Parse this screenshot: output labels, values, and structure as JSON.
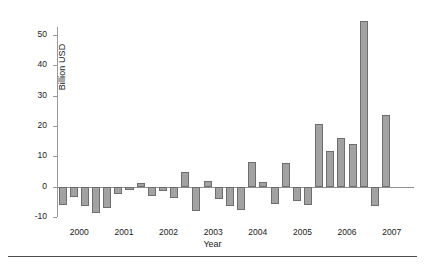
{
  "chart_data": {
    "type": "bar",
    "title": "",
    "xlabel": "Year",
    "ylabel": "Billion USD",
    "ylim": [
      -10,
      55
    ],
    "yticks": [
      -10,
      0,
      10,
      20,
      30,
      40,
      50
    ],
    "ytick_labels": [
      "-10",
      "0",
      "10",
      "20",
      "30",
      "40",
      "50"
    ],
    "xtick_labels": [
      "2000",
      "2001",
      "2002",
      "2003",
      "2004",
      "2005",
      "2006",
      "2007"
    ],
    "grid": false,
    "legend": null,
    "bar_color": "#a2a2a2",
    "bar_edge_color": "#6e6e6e",
    "categories": [
      "2000 Q1",
      "2000 Q2",
      "2000 Q3",
      "2000 Q4",
      "2001 Q1",
      "2001 Q2",
      "2001 Q3",
      "2001 Q4",
      "2002 Q1",
      "2002 Q2",
      "2002 Q3",
      "2002 Q4",
      "2003 Q1",
      "2003 Q2",
      "2003 Q3",
      "2003 Q4",
      "2004 Q1",
      "2004 Q2",
      "2004 Q3",
      "2004 Q4",
      "2005 Q1",
      "2005 Q2",
      "2005 Q3",
      "2005 Q4",
      "2006 Q1",
      "2006 Q2",
      "2006 Q3",
      "2006 Q4",
      "2007 Q1",
      "2007 Q2",
      "2007 Q3",
      "2007 Q4"
    ],
    "values": [
      -6.2,
      -3.4,
      -6.3,
      -8.6,
      -7.1,
      -2.3,
      -1.0,
      1.2,
      -3.0,
      -1.3,
      -3.7,
      4.7,
      -8.0,
      1.8,
      -4.1,
      -6.4,
      -7.7,
      8.3,
      1.7,
      -5.8,
      7.7,
      -4.7,
      -6.0,
      20.6,
      11.8,
      16.0,
      14.0,
      54.8,
      -6.4,
      23.8,
      null,
      null
    ]
  },
  "axis": {
    "y_label": "Billion USD",
    "x_label": "Year"
  }
}
